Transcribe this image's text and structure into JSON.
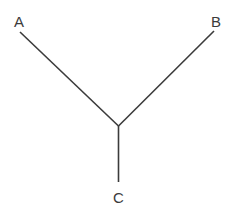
{
  "figure": {
    "title": "",
    "background_color": "#ffffff",
    "line_color": "#3b3b3b",
    "label_color": "#3b3b3b",
    "canvas": {
      "width": 235,
      "height": 211
    },
    "junction": {
      "x": 118.5,
      "y": 126
    },
    "vertices": [
      {
        "id": "A",
        "label": "A",
        "endpoint": {
          "x": 20,
          "y": 32
        },
        "label_pos": {
          "x": 14,
          "y": 27
        }
      },
      {
        "id": "B",
        "label": "B",
        "endpoint": {
          "x": 214,
          "y": 31
        },
        "label_pos": {
          "x": 211,
          "y": 27
        }
      },
      {
        "id": "C",
        "label": "C",
        "endpoint": {
          "x": 118.5,
          "y": 182
        },
        "label_pos": {
          "x": 113,
          "y": 203
        }
      }
    ],
    "edges": [
      {
        "id": "edge-a",
        "from": "junction",
        "to": "A"
      },
      {
        "id": "edge-b",
        "from": "junction",
        "to": "B"
      },
      {
        "id": "edge-c",
        "from": "junction",
        "to": "C"
      }
    ]
  }
}
